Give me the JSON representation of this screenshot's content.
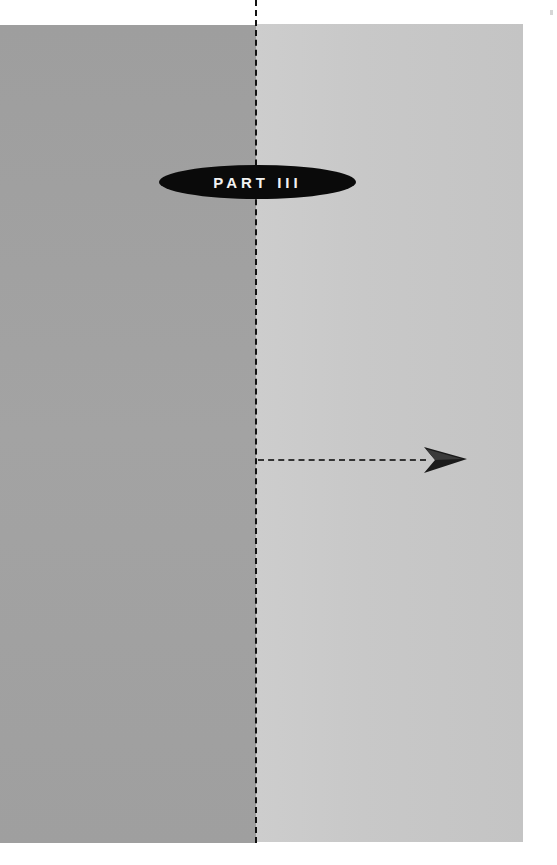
{
  "page": {
    "part_label": "PART III",
    "colors": {
      "left_panel": "#a0a0a0",
      "right_panel": "#c9c9c9",
      "badge_fill": "#0a0a0a",
      "badge_text": "#f2f2f2",
      "divider": "#111111"
    },
    "decorations": {
      "divider": "dashed-vertical-line",
      "pointer": "dashed-arrow-right"
    }
  }
}
